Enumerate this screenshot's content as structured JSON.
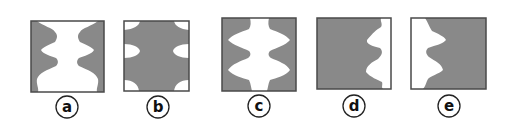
{
  "figure": {
    "fill_color": "#898989",
    "border_color": "#4a4a4a",
    "background_color": "#ffffff",
    "panels": [
      {
        "id": "a",
        "label": "a",
        "description": "Symmetric white silhouette (vase/profile figure) centered on gray background, white at top and bottom edges, two wide bulges"
      },
      {
        "id": "b",
        "label": "b",
        "description": "Gray square with small white half-ovals protruding from left and right edges at top, middle and bottom"
      },
      {
        "id": "c",
        "label": "c",
        "description": "Symmetric white silhouette centered, narrower at top/bottom with two wide bulges reaching near the edges"
      },
      {
        "id": "d",
        "label": "d",
        "description": "Gray region on left with white wavy profile on right edge, two white bulges pointing left"
      },
      {
        "id": "e",
        "label": "e",
        "description": "White wavy profile on left edge with two bulges pointing right into gray region"
      }
    ]
  }
}
